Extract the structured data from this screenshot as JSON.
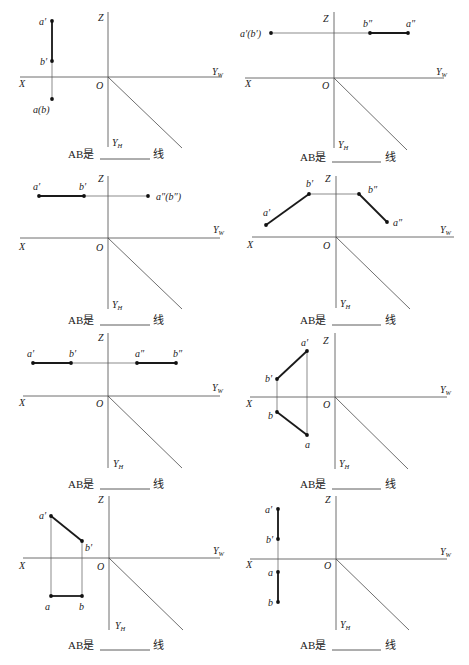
{
  "page": {
    "caption_prefix": "AB是",
    "caption_suffix": "线",
    "axis_labels": {
      "z": "Z",
      "x": "X",
      "o": "O",
      "yw": "Y",
      "yw_sub": "W",
      "yh": "Y",
      "yh_sub": "H"
    }
  },
  "panels": [
    {
      "id": 1,
      "origin": [
        108,
        77
      ],
      "z_top": 12,
      "z_bottom": 147,
      "x_left": 20,
      "x_right": 222,
      "diag_end": [
        182,
        148
      ],
      "thin_lines": [
        [
          [
            52,
            21
          ],
          [
            52,
            99
          ]
        ]
      ],
      "thick_lines": [
        [
          [
            52,
            21
          ],
          [
            52,
            61
          ]
        ]
      ],
      "points": [
        [
          52,
          21
        ],
        [
          52,
          61
        ],
        [
          52,
          99
        ]
      ],
      "labels": [
        {
          "text": "a′",
          "x": 39,
          "y": 25
        },
        {
          "text": "b′",
          "x": 40,
          "y": 65
        },
        {
          "text": "a(b)",
          "x": 33,
          "y": 113
        }
      ],
      "axis_pos": {
        "z": [
          98,
          21
        ],
        "yw": [
          212,
          75
        ],
        "x": [
          19,
          87
        ],
        "o": [
          96,
          89
        ],
        "yh": [
          112,
          146
        ]
      },
      "caption_y": 158,
      "caption_x": 68,
      "blank": [
        100,
        150
      ],
      "suffix_x": 153
    },
    {
      "id": 2,
      "origin": [
        334,
        78
      ],
      "z_top": 12,
      "z_bottom": 148,
      "x_left": 245,
      "x_right": 444,
      "diag_end": [
        407,
        150
      ],
      "thin_lines": [
        [
          [
            271,
            33
          ],
          [
            409,
            33
          ]
        ]
      ],
      "thick_lines": [
        [
          [
            370,
            33
          ],
          [
            408,
            33
          ]
        ]
      ],
      "points": [
        [
          271,
          33
        ],
        [
          370,
          33
        ],
        [
          408,
          33
        ]
      ],
      "labels": [
        {
          "text": "a′(b′)",
          "x": 240,
          "y": 37
        },
        {
          "text": "b″",
          "x": 363,
          "y": 27
        },
        {
          "text": "a″",
          "x": 406,
          "y": 27
        }
      ],
      "axis_pos": {
        "z": [
          323,
          22
        ],
        "yw": [
          436,
          75
        ],
        "x": [
          245,
          87
        ],
        "o": [
          322,
          89
        ],
        "yh": [
          338,
          148
        ]
      },
      "caption_y": 161,
      "caption_x": 300,
      "blank": [
        332,
        381
      ],
      "suffix_x": 385
    },
    {
      "id": 3,
      "origin": [
        108,
        238
      ],
      "z_top": 176,
      "z_bottom": 309,
      "x_left": 20,
      "x_right": 220,
      "diag_end": [
        182,
        309
      ],
      "thin_lines": [
        [
          [
            39,
            196
          ],
          [
            148,
            196
          ]
        ]
      ],
      "thick_lines": [
        [
          [
            39,
            196
          ],
          [
            84,
            196
          ]
        ]
      ],
      "points": [
        [
          39,
          196
        ],
        [
          84,
          196
        ],
        [
          148,
          196
        ]
      ],
      "labels": [
        {
          "text": "a′",
          "x": 33,
          "y": 190
        },
        {
          "text": "b′",
          "x": 79,
          "y": 190
        },
        {
          "text": "a″(b″)",
          "x": 156,
          "y": 200
        }
      ],
      "axis_pos": {
        "z": [
          98,
          182
        ],
        "yw": [
          213,
          233
        ],
        "x": [
          19,
          250
        ],
        "o": [
          96,
          251
        ],
        "yh": [
          112,
          308
        ]
      },
      "caption_y": 324,
      "caption_x": 68,
      "blank": [
        100,
        150
      ],
      "suffix_x": 153
    },
    {
      "id": 4,
      "origin": [
        336,
        237
      ],
      "z_top": 176,
      "z_bottom": 308,
      "x_left": 252,
      "x_right": 454,
      "diag_end": [
        410,
        309
      ],
      "thin_lines": [
        [
          [
            309,
            194
          ],
          [
            359,
            194
          ]
        ]
      ],
      "thick_lines": [
        [
          [
            266,
            225
          ],
          [
            309,
            194
          ]
        ],
        [
          [
            359,
            194
          ],
          [
            387,
            222
          ]
        ]
      ],
      "points": [
        [
          266,
          225
        ],
        [
          309,
          194
        ],
        [
          359,
          194
        ],
        [
          387,
          222
        ]
      ],
      "labels": [
        {
          "text": "a′",
          "x": 263,
          "y": 216
        },
        {
          "text": "b′",
          "x": 306,
          "y": 187
        },
        {
          "text": "b″",
          "x": 368,
          "y": 193
        },
        {
          "text": "a″",
          "x": 393,
          "y": 226
        }
      ],
      "axis_pos": {
        "z": [
          325,
          182
        ],
        "yw": [
          440,
          233
        ],
        "x": [
          247,
          248
        ],
        "o": [
          323,
          249
        ],
        "yh": [
          340,
          307
        ]
      },
      "caption_y": 324,
      "caption_x": 300,
      "blank": [
        332,
        381
      ],
      "suffix_x": 385
    },
    {
      "id": 5,
      "origin": [
        108,
        396
      ],
      "z_top": 333,
      "z_bottom": 468,
      "x_left": 23,
      "x_right": 220,
      "diag_end": [
        182,
        468
      ],
      "thin_lines": [
        [
          [
            33,
            363
          ],
          [
            176,
            363
          ]
        ]
      ],
      "thick_lines": [
        [
          [
            33,
            363
          ],
          [
            71,
            363
          ]
        ],
        [
          [
            137,
            363
          ],
          [
            176,
            363
          ]
        ]
      ],
      "points": [
        [
          33,
          363
        ],
        [
          71,
          363
        ],
        [
          137,
          363
        ],
        [
          176,
          363
        ]
      ],
      "labels": [
        {
          "text": "a′",
          "x": 27,
          "y": 357
        },
        {
          "text": "b′",
          "x": 69,
          "y": 357
        },
        {
          "text": "a″",
          "x": 135,
          "y": 357
        },
        {
          "text": "b″",
          "x": 173,
          "y": 357
        }
      ],
      "axis_pos": {
        "z": [
          98,
          341
        ],
        "yw": [
          212,
          391
        ],
        "x": [
          19,
          406
        ],
        "o": [
          96,
          407
        ],
        "yh": [
          113,
          467
        ]
      },
      "caption_y": 488,
      "caption_x": 68,
      "blank": [
        100,
        150
      ],
      "suffix_x": 153
    },
    {
      "id": 6,
      "origin": [
        335,
        397
      ],
      "z_top": 333,
      "z_bottom": 469,
      "x_left": 250,
      "x_right": 447,
      "diag_end": [
        408,
        469
      ],
      "thin_lines": [
        [
          [
            277,
            379
          ],
          [
            277,
            412
          ]
        ],
        [
          [
            307,
            351
          ],
          [
            307,
            435
          ]
        ]
      ],
      "thick_lines": [
        [
          [
            307,
            351
          ],
          [
            277,
            379
          ]
        ],
        [
          [
            277,
            412
          ],
          [
            307,
            435
          ]
        ]
      ],
      "points": [
        [
          307,
          351
        ],
        [
          277,
          379
        ],
        [
          277,
          412
        ],
        [
          307,
          435
        ]
      ],
      "labels": [
        {
          "text": "a′",
          "x": 301,
          "y": 346
        },
        {
          "text": "b′",
          "x": 265,
          "y": 382
        },
        {
          "text": "b",
          "x": 268,
          "y": 419
        },
        {
          "text": "a",
          "x": 305,
          "y": 448
        }
      ],
      "axis_pos": {
        "z": [
          323,
          344
        ],
        "yw": [
          440,
          393
        ],
        "x": [
          246,
          407
        ],
        "o": [
          323,
          408
        ],
        "yh": [
          339,
          467
        ]
      },
      "caption_y": 488,
      "caption_x": 300,
      "blank": [
        332,
        381
      ],
      "suffix_x": 385
    },
    {
      "id": 7,
      "origin": [
        109,
        558
      ],
      "z_top": 496,
      "z_bottom": 630,
      "x_left": 23,
      "x_right": 220,
      "diag_end": [
        183,
        630
      ],
      "thin_lines": [
        [
          [
            51,
            516
          ],
          [
            51,
            596
          ]
        ],
        [
          [
            82,
            541
          ],
          [
            82,
            596
          ]
        ]
      ],
      "thick_lines": [
        [
          [
            51,
            516
          ],
          [
            82,
            541
          ]
        ],
        [
          [
            51,
            596
          ],
          [
            82,
            596
          ]
        ]
      ],
      "points": [
        [
          51,
          516
        ],
        [
          82,
          541
        ],
        [
          51,
          596
        ],
        [
          82,
          596
        ]
      ],
      "labels": [
        {
          "text": "a′",
          "x": 39,
          "y": 519
        },
        {
          "text": "b′",
          "x": 85,
          "y": 551
        },
        {
          "text": "a",
          "x": 45,
          "y": 610
        },
        {
          "text": "b",
          "x": 79,
          "y": 610
        }
      ],
      "axis_pos": {
        "z": [
          98,
          503
        ],
        "yw": [
          213,
          554
        ],
        "x": [
          19,
          569
        ],
        "o": [
          97,
          570
        ],
        "yh": [
          115,
          629
        ]
      },
      "caption_y": 649,
      "caption_x": 68,
      "blank": [
        100,
        150
      ],
      "suffix_x": 153
    },
    {
      "id": 8,
      "origin": [
        336,
        559
      ],
      "z_top": 496,
      "z_bottom": 630,
      "x_left": 250,
      "x_right": 447,
      "diag_end": [
        409,
        630
      ],
      "thin_lines": [
        [
          [
            278,
            509
          ],
          [
            278,
            602
          ]
        ]
      ],
      "thick_lines": [
        [
          [
            278,
            509
          ],
          [
            278,
            539
          ]
        ],
        [
          [
            278,
            572
          ],
          [
            278,
            602
          ]
        ]
      ],
      "points": [
        [
          278,
          509
        ],
        [
          278,
          539
        ],
        [
          278,
          572
        ],
        [
          278,
          602
        ]
      ],
      "labels": [
        {
          "text": "a′",
          "x": 265,
          "y": 513
        },
        {
          "text": "b′",
          "x": 266,
          "y": 543
        },
        {
          "text": "a",
          "x": 268,
          "y": 576
        },
        {
          "text": "b",
          "x": 268,
          "y": 606
        }
      ],
      "axis_pos": {
        "z": [
          325,
          503
        ],
        "yw": [
          440,
          555
        ],
        "x": [
          246,
          568
        ],
        "o": [
          324,
          569
        ],
        "yh": [
          340,
          628
        ]
      },
      "caption_y": 649,
      "caption_x": 300,
      "blank": [
        332,
        381
      ],
      "suffix_x": 385
    }
  ]
}
